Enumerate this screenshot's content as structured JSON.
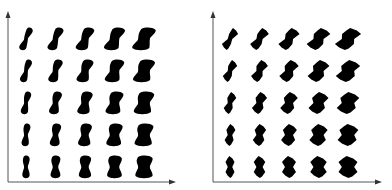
{
  "figure": {
    "panels": [
      {
        "id": "smooth",
        "shape_style": "smooth",
        "rows": 5,
        "cols": 5,
        "x_axis": {
          "label": "",
          "direction": "increasing width"
        },
        "y_axis": {
          "label": "",
          "direction": "increasing skew"
        }
      },
      {
        "id": "angular",
        "shape_style": "angular",
        "rows": 5,
        "cols": 5,
        "x_axis": {
          "label": "",
          "direction": "increasing width"
        },
        "y_axis": {
          "label": "",
          "direction": "increasing skew"
        }
      }
    ],
    "colors": {
      "shape": "#000000",
      "axis": "#555555",
      "background": "#ffffff"
    },
    "width_levels": [
      0,
      0.25,
      0.5,
      0.75,
      1.0
    ],
    "skew_levels_top_to_bottom": [
      1.0,
      0.75,
      0.5,
      0.25,
      0
    ]
  }
}
